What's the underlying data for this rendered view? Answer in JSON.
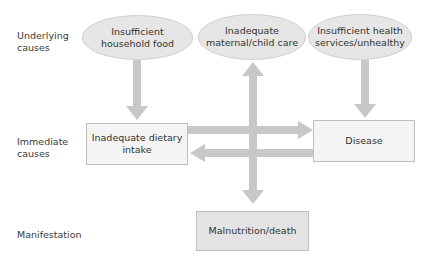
{
  "row_labels": {
    "underlying": "Underlying\ncauses",
    "immediate": "Immediate\ncauses",
    "manifestation": "Manifestation"
  },
  "underlying_causes": [
    {
      "label": "Insufficient\nhousehold food"
    },
    {
      "label": "Inadequate\nmaternal/child care"
    },
    {
      "label": "Insufficient health\nservices/unhealthy"
    }
  ],
  "immediate_causes": [
    {
      "label": "Inadequate dietary\nintake"
    },
    {
      "label": "Disease"
    }
  ],
  "manifestation": {
    "label": "Malnutrition/death"
  },
  "colors": {
    "ellipse_fill": "#e6e6e6",
    "box_fill": "#f4f4f4",
    "manifestation_fill": "#e3e3e3",
    "arrow": "#c8c8c8"
  },
  "connections": [
    {
      "from": "Insufficient household food",
      "to": "Inadequate dietary intake",
      "type": "one-way"
    },
    {
      "from": "Insufficient health services/unhealthy",
      "to": "Disease",
      "type": "one-way"
    },
    {
      "from": "Inadequate dietary intake",
      "to": "Disease",
      "type": "one-way"
    },
    {
      "from": "Disease",
      "to": "Inadequate dietary intake",
      "type": "one-way"
    },
    {
      "from": "Inadequate maternal/child care",
      "to": "Malnutrition/death",
      "type": "two-way"
    }
  ]
}
